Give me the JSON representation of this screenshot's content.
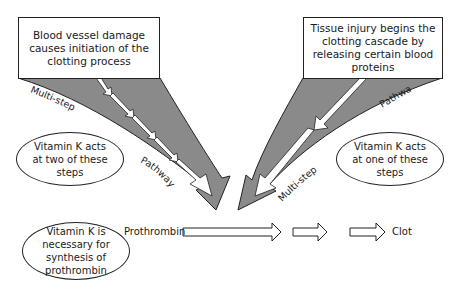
{
  "diagram": {
    "colors": {
      "pathway_fill": "#8a8a8a",
      "outline": "#222222",
      "background": "#ffffff"
    },
    "boxes": {
      "left": {
        "text": "Blood vessel damage causes initiation of the clotting process"
      },
      "right": {
        "text": "Tissue injury begins the clotting cascade by releasing certain blood proteins"
      }
    },
    "pathway_labels": {
      "left_upper": "Multi-step",
      "left_lower": "Pathway",
      "right_upper": "Pathway",
      "right_lower": "Multi-step"
    },
    "ellipses": {
      "left_steps": "Vitamin K acts at two of these steps",
      "right_steps": "Vitamin K acts at one of these steps",
      "synthesis": "Vitamin K is necessary for synthesis of prothrombin"
    },
    "flow": {
      "start": "Prothrombin",
      "end": "Clot",
      "arrow_count": 3
    }
  }
}
